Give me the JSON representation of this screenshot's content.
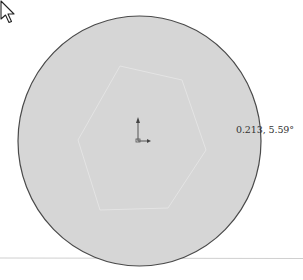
{
  "canvas": {
    "background": "#ffffff",
    "shape": {
      "type": "circle",
      "fill": "#d6d6d6",
      "stroke": "#4a4a4a"
    },
    "inner_sketch": {
      "type": "hexagon",
      "stroke": "#e6e6e6"
    },
    "origin_marker": {
      "color": "#555555"
    }
  },
  "readout": {
    "text": "0.213, 5.59°"
  },
  "cursor": {
    "type": "arrow-pointer"
  }
}
